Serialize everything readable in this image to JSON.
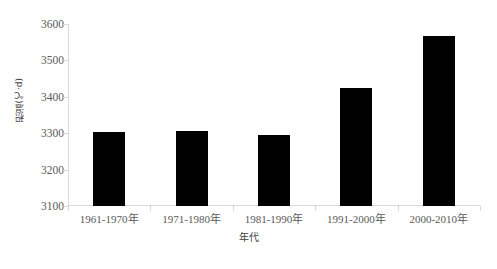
{
  "chart_data": {
    "type": "bar",
    "title": "",
    "subtitle": "",
    "xlabel": "年代",
    "ylabel": "积温(℃·d)",
    "categories": [
      "1961-1970年",
      "1971-1980年",
      "1981-1990年",
      "1991-2000年",
      "2000-2010年"
    ],
    "values": [
      3302,
      3306,
      3294,
      3423,
      3567
    ],
    "ylim": [
      3100,
      3600
    ],
    "yticks": [
      3100,
      3200,
      3300,
      3400,
      3500,
      3600
    ],
    "ytick_labels": [
      "3100",
      "3200",
      "3300",
      "3400",
      "3500",
      "3600"
    ],
    "grid": false,
    "legend": null,
    "legend_position": "none",
    "bar_color": "#000000",
    "axis_color": "#d9d9d9",
    "text_color": "#595959",
    "background": "#ffffff",
    "bar_count": 5
  }
}
